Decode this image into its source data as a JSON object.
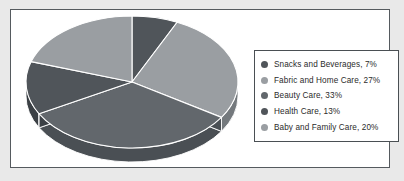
{
  "chart_data": {
    "type": "pie",
    "title": "",
    "subtitle": "",
    "xlabel": "",
    "ylabel": "",
    "three_d": true,
    "start_angle_deg": 0,
    "direction": "clockwise",
    "grid": false,
    "legend_position": "right",
    "categories": [
      "Snacks and Beverages",
      "Fabric and Home Care",
      "Beauty Care",
      "Health Care",
      "Baby and Family Care"
    ],
    "values": [
      7,
      27,
      33,
      13,
      20
    ],
    "units": "%",
    "total": 100,
    "slices": [
      {
        "label": "Snacks and Beverages",
        "value": 7,
        "display": "7%",
        "color": "#50555a",
        "side_color": "#3b4045"
      },
      {
        "label": "Fabric and Home Care",
        "value": 27,
        "display": "27%",
        "color": "#9a9ea2",
        "side_color": "#74797d"
      },
      {
        "label": "Beauty Care",
        "value": 33,
        "display": "33%",
        "color": "#62676c",
        "side_color": "#4a4f54"
      },
      {
        "label": "Health Care",
        "value": 13,
        "display": "13%",
        "color": "#50555a",
        "side_color": "#3b4045"
      },
      {
        "label": "Baby and Family Care",
        "value": 20,
        "display": "20%",
        "color": "#9a9ea2",
        "side_color": "#74797d"
      }
    ],
    "separator_color": "#ffffff",
    "plot_background": "#ffffff",
    "outer_background": "#e9e9e9",
    "frame_border_color": "#555a5e"
  },
  "legend": {
    "border_color": "#4a4f53",
    "background": "#ffffff",
    "entries": [
      {
        "marker": "legend-marker-snacks",
        "text": "Snacks and Beverages, 7%",
        "color": "#50555a"
      },
      {
        "marker": "legend-marker-fabric",
        "text": "Fabric and Home Care, 27%",
        "color": "#9a9ea2"
      },
      {
        "marker": "legend-marker-beauty",
        "text": "Beauty Care, 33%",
        "color": "#62676c"
      },
      {
        "marker": "legend-marker-health",
        "text": "Health Care, 13%",
        "color": "#50555a"
      },
      {
        "marker": "legend-marker-baby",
        "text": "Baby and Family Care, 20%",
        "color": "#9a9ea2"
      }
    ]
  }
}
